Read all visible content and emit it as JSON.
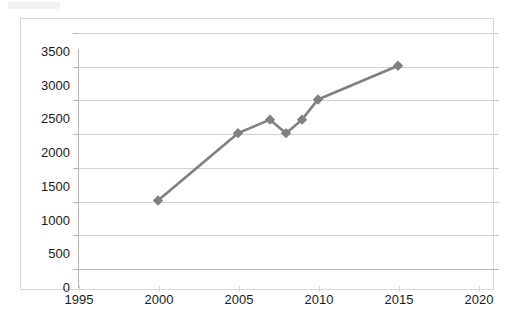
{
  "chart_data": {
    "type": "line",
    "title": "",
    "subtitle": "",
    "xlabel": "",
    "ylabel": "",
    "xlim": [
      1995,
      2020
    ],
    "ylim": [
      0,
      3500
    ],
    "grid": true,
    "legend": false,
    "legend_position": "none",
    "marker": "diamond",
    "series_color": "#808080",
    "x_ticks": [
      "1995",
      "2000",
      "2005",
      "2010",
      "2015",
      "2020"
    ],
    "x_tick_values": [
      1995,
      2000,
      2005,
      2010,
      2015,
      2020
    ],
    "y_ticks": [
      "0",
      "500",
      "1000",
      "1500",
      "2000",
      "2500",
      "3000",
      "3500"
    ],
    "y_tick_values": [
      0,
      500,
      1000,
      1500,
      2000,
      2500,
      3000,
      3500
    ],
    "series": [
      {
        "name": "",
        "x": [
          2000,
          2005,
          2007,
          2008,
          2009,
          2010,
          2015
        ],
        "values": [
          1000,
          2000,
          2200,
          2000,
          2200,
          2500,
          3000
        ]
      }
    ]
  },
  "colors": {
    "line": "#808080",
    "marker": "#808080",
    "gridline": "#d0d0d0",
    "axis": "#b5b5b5",
    "frame_border": "#d9d9d9",
    "text": "#1a1a1a",
    "background": "#ffffff"
  }
}
